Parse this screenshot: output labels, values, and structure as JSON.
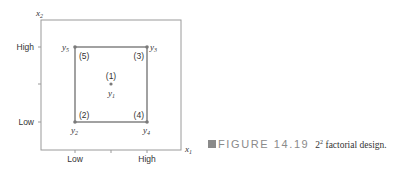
{
  "diagram": {
    "axes": {
      "x_label": "x",
      "x_label_sub": "1",
      "y_label": "x",
      "y_label_sub": "2",
      "x_ticks": [
        "Low",
        "High"
      ],
      "y_ticks": [
        "High",
        "Low"
      ]
    },
    "points": [
      {
        "run": "(1)",
        "response": "y",
        "response_sub": "1",
        "position": "center"
      },
      {
        "run": "(2)",
        "response": "y",
        "response_sub": "2",
        "position": "low-low"
      },
      {
        "run": "(3)",
        "response": "y",
        "response_sub": "3",
        "position": "high-high"
      },
      {
        "run": "(4)",
        "response": "y",
        "response_sub": "4",
        "position": "high-low"
      },
      {
        "run": "(5)",
        "response": "y",
        "response_sub": "5",
        "position": "low-high"
      }
    ],
    "colors": {
      "frame": "#9a9a9a",
      "square": "#8a8a8a",
      "point": "#7a7a7a",
      "text": "#333333"
    }
  },
  "caption": {
    "figure_label": "FIGURE 14.19",
    "base": "2",
    "exponent": "2",
    "text": " factorial design."
  }
}
